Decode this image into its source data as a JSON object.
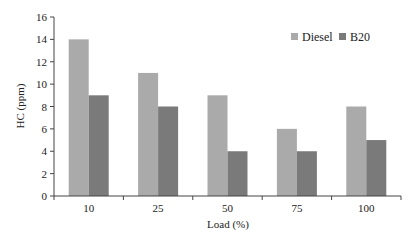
{
  "chart_data": {
    "type": "bar",
    "title": "",
    "xlabel": "Load (%)",
    "ylabel": "HC (ppm)",
    "categories": [
      "10",
      "25",
      "50",
      "75",
      "100"
    ],
    "series": [
      {
        "name": "Diesel",
        "values": [
          14,
          11,
          9,
          6,
          8
        ],
        "color": "#aaaaaa"
      },
      {
        "name": "B20",
        "values": [
          9,
          8,
          4,
          4,
          5
        ],
        "color": "#7a7a7a"
      }
    ],
    "ylim": [
      0,
      16
    ],
    "yticks": [
      0,
      2,
      4,
      6,
      8,
      10,
      12,
      14,
      16
    ],
    "grid": false,
    "legend_position": "top-right"
  }
}
